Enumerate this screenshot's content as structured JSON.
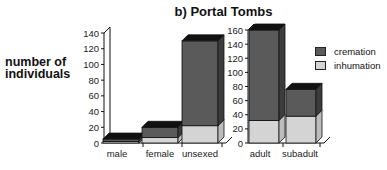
{
  "chart_data": [
    {
      "type": "bar",
      "stacked": true,
      "style": "3d",
      "title": "b) Portal Tombs",
      "ylabel": "number of individuals",
      "xlabel": "",
      "categories": [
        "male",
        "female",
        "unsexed"
      ],
      "series": [
        {
          "name": "inhumation",
          "values": [
            2,
            7,
            22
          ]
        },
        {
          "name": "cremation",
          "values": [
            3,
            13,
            108
          ]
        }
      ],
      "ylim": [
        0,
        140
      ],
      "yticks": [
        0,
        20,
        40,
        60,
        80,
        100,
        120,
        140
      ],
      "grid": false
    },
    {
      "type": "bar",
      "stacked": true,
      "style": "3d",
      "categories": [
        "adult",
        "subadult"
      ],
      "series": [
        {
          "name": "inhumation",
          "values": [
            32,
            38
          ]
        },
        {
          "name": "cremation",
          "values": [
            128,
            38
          ]
        }
      ],
      "ylim": [
        0,
        160
      ],
      "yticks": [
        0,
        20,
        40,
        60,
        80,
        100,
        120,
        140,
        160
      ],
      "grid": false
    }
  ],
  "title": "b) Portal Tombs",
  "ylabel_line1": "number of",
  "ylabel_line2": "individuals",
  "legend": [
    {
      "name": "cremation",
      "color": "#5a5a5a"
    },
    {
      "name": "inhumation",
      "color": "#d4d4d4"
    }
  ],
  "colors": {
    "cremation": "#5a5a5a",
    "inhumation": "#d4d4d4",
    "top": "#111111"
  }
}
